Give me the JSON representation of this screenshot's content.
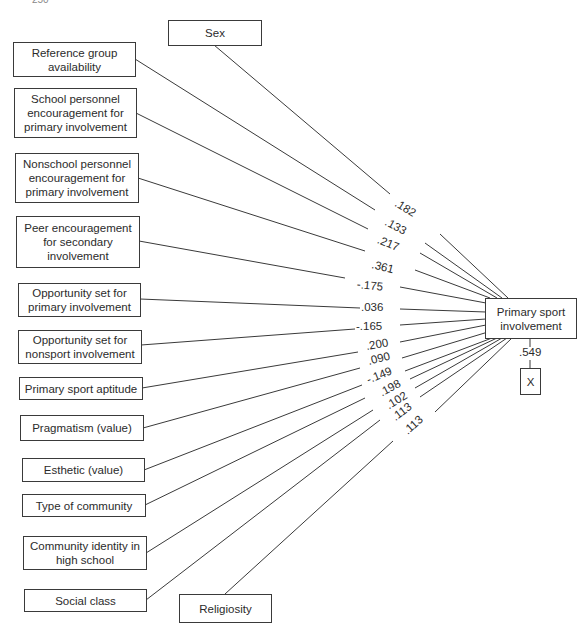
{
  "page_number": "250",
  "dependent": {
    "label": "Primary sport involvement"
  },
  "residual": {
    "label": "X",
    "coefficient": ".549"
  },
  "predictors": [
    {
      "id": "sex",
      "label": "Sex",
      "coefficient": ".182"
    },
    {
      "id": "reference-group",
      "label": "Reference group availability",
      "coefficient": ".133"
    },
    {
      "id": "school-personnel",
      "label": "School personnel encouragement for primary involvement",
      "coefficient": ".217"
    },
    {
      "id": "nonschool-personnel",
      "label": "Nonschool personnel encouragement for primary involvement",
      "coefficient": ".361"
    },
    {
      "id": "peer-encouragement",
      "label": "Peer encouragement for secondary involvement",
      "coefficient": "-.175"
    },
    {
      "id": "opportunity-primary",
      "label": "Opportunity set for primary involvement",
      "coefficient": ".036"
    },
    {
      "id": "opportunity-nonsport",
      "label": "Opportunity set for nonsport involvement",
      "coefficient": "-.165"
    },
    {
      "id": "sport-aptitude",
      "label": "Primary sport aptitude",
      "coefficient": ".200"
    },
    {
      "id": "pragmatism",
      "label": "Pragmatism (value)",
      "coefficient": ".090"
    },
    {
      "id": "esthetic",
      "label": "Esthetic (value)",
      "coefficient": "-.149"
    },
    {
      "id": "type-of-community",
      "label": "Type of community",
      "coefficient": ".198"
    },
    {
      "id": "community-identity",
      "label": "Community identity in high school",
      "coefficient": ".102"
    },
    {
      "id": "social-class",
      "label": "Social class",
      "coefficient": ".113"
    },
    {
      "id": "religiosity",
      "label": "Religiosity",
      "coefficient": ".113"
    }
  ]
}
